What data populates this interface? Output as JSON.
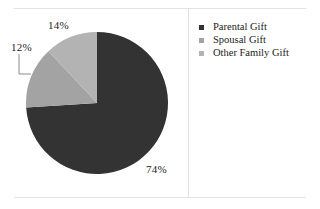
{
  "chart_data": {
    "type": "pie",
    "title": "",
    "categories": [
      "Parental Gift",
      "Spousal Gift",
      "Other Family Gift"
    ],
    "values": [
      74,
      14,
      12
    ],
    "value_labels": [
      "74%",
      "14%",
      "12%"
    ],
    "colors": [
      "#333333",
      "#a3a3a3",
      "#b3b3b3"
    ],
    "legend_position": "right",
    "grid": false,
    "start_angle_deg": 0,
    "direction": "clockwise",
    "units": "percent"
  },
  "legend": {
    "items": [
      {
        "label": "Parental Gift",
        "color": "#333333"
      },
      {
        "label": "Spousal Gift",
        "color": "#a3a3a3"
      },
      {
        "label": "Other Family Gift",
        "color": "#b3b3b3"
      }
    ]
  },
  "labels": {
    "parental": "74%",
    "spousal": "14%",
    "other_family": "12%"
  }
}
